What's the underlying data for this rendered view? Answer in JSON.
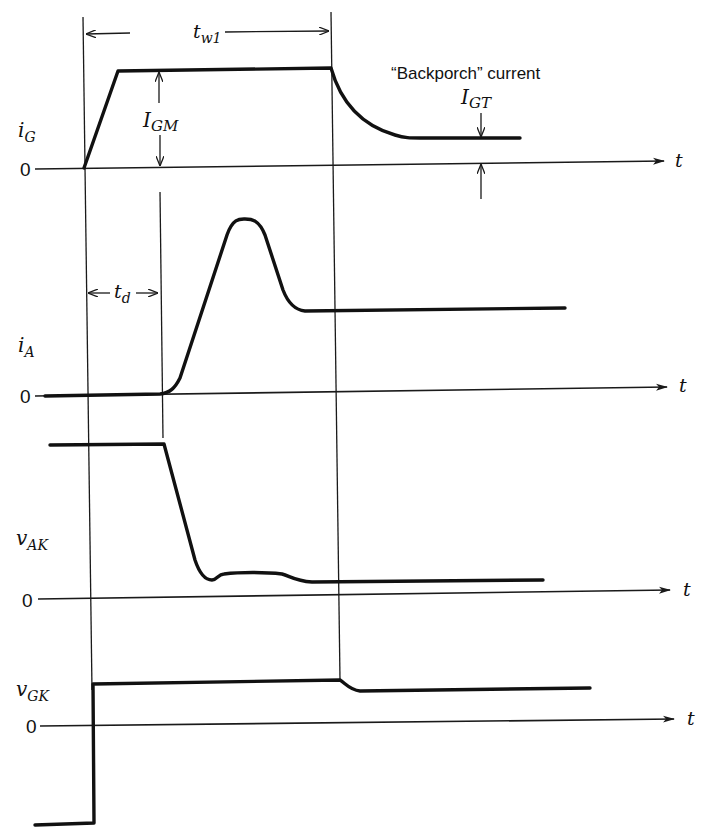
{
  "diagram": {
    "type": "timing-waveform",
    "time_axis_label": "t",
    "zero_label": "0",
    "traces": [
      {
        "id": "iG",
        "label_main": "i",
        "label_sub": "G",
        "description": "Gate current: ramps to I_GM plateau for t_w1, then decays to backporch current I_GT"
      },
      {
        "id": "iA",
        "label_main": "i",
        "label_sub": "A",
        "description": "Anode current: zero during delay t_d, rises to a peak, settles to steady value"
      },
      {
        "id": "vAK",
        "label_main": "v",
        "label_sub": "AK",
        "description": "Anode-cathode voltage: high until end of t_d, falls to low on-state level"
      },
      {
        "id": "vGK",
        "label_main": "v",
        "label_sub": "GK",
        "description": "Gate-cathode voltage: negative before pulse, steps positive, drops slightly after t_w1"
      }
    ],
    "annotations": {
      "tw1": {
        "main": "t",
        "sub": "w1"
      },
      "IGM": {
        "main": "I",
        "sub": "GM"
      },
      "td": {
        "main": "t",
        "sub": "d"
      },
      "IGT": {
        "main": "I",
        "sub": "GT"
      },
      "backporch_text": "“Backporch” current"
    }
  }
}
